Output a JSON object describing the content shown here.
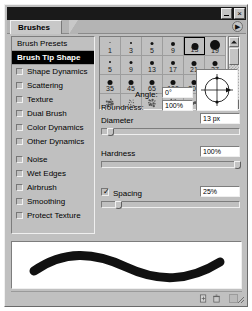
{
  "window": {
    "title": "",
    "minimize_label": "–",
    "close_label": "×"
  },
  "tab": {
    "label": "Brushes",
    "menu_icon": "▶"
  },
  "sidebar": {
    "items": [
      {
        "label": "Brush Presets",
        "type": "header",
        "selected": false,
        "checked": false
      },
      {
        "label": "Brush Tip Shape",
        "type": "header",
        "selected": true,
        "checked": false
      },
      {
        "label": "Shape Dynamics",
        "type": "checkbox",
        "selected": false,
        "checked": false
      },
      {
        "label": "Scattering",
        "type": "checkbox",
        "selected": false,
        "checked": false
      },
      {
        "label": "Texture",
        "type": "checkbox",
        "selected": false,
        "checked": false
      },
      {
        "label": "Dual Brush",
        "type": "checkbox",
        "selected": false,
        "checked": false
      },
      {
        "label": "Color Dynamics",
        "type": "checkbox",
        "selected": false,
        "checked": false
      },
      {
        "label": "Other Dynamics",
        "type": "checkbox",
        "selected": false,
        "checked": false
      },
      {
        "label": "Noise",
        "type": "checkbox",
        "selected": false,
        "checked": false
      },
      {
        "label": "Wet Edges",
        "type": "checkbox",
        "selected": false,
        "checked": false
      },
      {
        "label": "Airbrush",
        "type": "checkbox",
        "selected": false,
        "checked": false
      },
      {
        "label": "Smoothing",
        "type": "checkbox",
        "selected": false,
        "checked": false
      },
      {
        "label": "Protect Texture",
        "type": "checkbox",
        "selected": false,
        "checked": false
      }
    ]
  },
  "brush_grid": {
    "rows": [
      [
        {
          "size": "1",
          "dot": 1,
          "selected": false,
          "irregular": false
        },
        {
          "size": "3",
          "dot": 2,
          "selected": false,
          "irregular": false
        },
        {
          "size": "5",
          "dot": 3,
          "selected": false,
          "irregular": false
        },
        {
          "size": "9",
          "dot": 4,
          "selected": false,
          "irregular": false
        },
        {
          "size": "13",
          "dot": 7,
          "selected": true,
          "irregular": false
        },
        {
          "size": "19",
          "dot": 10,
          "selected": false,
          "irregular": false
        }
      ],
      [
        {
          "size": "5",
          "dot": 2,
          "selected": false,
          "irregular": false
        },
        {
          "size": "9",
          "dot": 3,
          "selected": false,
          "irregular": false
        },
        {
          "size": "13",
          "dot": 4,
          "selected": false,
          "irregular": false
        },
        {
          "size": "17",
          "dot": 4,
          "selected": false,
          "irregular": false
        },
        {
          "size": "21",
          "dot": 5,
          "selected": false,
          "irregular": false
        },
        {
          "size": "27",
          "dot": 5,
          "selected": false,
          "irregular": false
        }
      ],
      [
        {
          "size": "35",
          "dot": 5,
          "selected": false,
          "irregular": false
        },
        {
          "size": "45",
          "dot": 5,
          "selected": false,
          "irregular": false
        },
        {
          "size": "65",
          "dot": 5,
          "selected": false,
          "irregular": false
        },
        {
          "size": "100",
          "dot": 5,
          "selected": false,
          "irregular": false
        },
        {
          "size": "200",
          "dot": 5,
          "selected": false,
          "irregular": false
        },
        {
          "size": "300",
          "dot": 5,
          "selected": false,
          "irregular": false
        }
      ],
      [
        {
          "size": "",
          "dot": 0,
          "selected": false,
          "irregular": true
        },
        {
          "size": "",
          "dot": 0,
          "selected": false,
          "irregular": true
        },
        {
          "size": "",
          "dot": 0,
          "selected": false,
          "irregular": true
        },
        {
          "size": "",
          "dot": 0,
          "selected": false,
          "irregular": true
        },
        {
          "size": "",
          "dot": 0,
          "selected": false,
          "irregular": true
        },
        {
          "size": "",
          "dot": 0,
          "selected": false,
          "irregular": true
        }
      ]
    ]
  },
  "controls": {
    "diameter": {
      "label": "Diameter",
      "value": "13 px",
      "slider_pct": 4
    },
    "angle": {
      "label": "Angle:",
      "value": "0°"
    },
    "roundness": {
      "label": "Roundness:",
      "value": "100%"
    },
    "hardness": {
      "label": "Hardness",
      "value": "100%",
      "slider_pct": 100
    },
    "spacing": {
      "label": "Spacing",
      "value": "25%",
      "checked": true,
      "check_glyph": "✓",
      "slider_pct": 10
    }
  },
  "statusbar": {
    "new_brush_icon": "new-brush-icon",
    "delete_brush_icon": "trash-icon",
    "lock_icon": "lock-icon"
  },
  "colors": {
    "panel_bg": "#c0c0c0",
    "titlebar": "#1a1a1a",
    "selected_item_bg": "#000000",
    "field_bg": "#ffffff",
    "stroke": "#111111"
  }
}
